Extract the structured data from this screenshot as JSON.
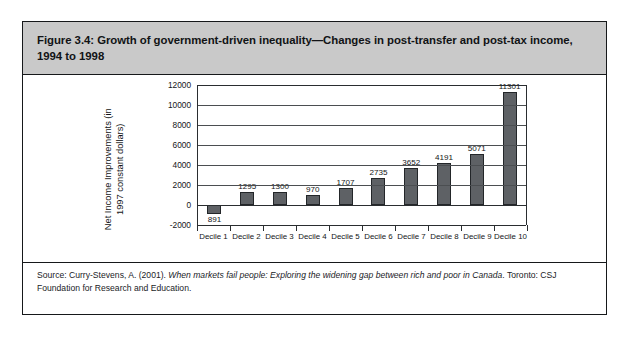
{
  "figure": {
    "title": "Figure 3.4: Growth of government-driven inequality—Changes in post-transfer and post-tax income, 1994 to 1998",
    "source_prefix": "Source: Curry-Stevens, A. (2001). ",
    "source_italic": "When markets fail people: Exploring the widening gap between rich and poor in Canada",
    "source_suffix": ". Toronto: CSJ Foundation for Research and Education."
  },
  "chart_data": {
    "type": "bar",
    "title": "",
    "categories": [
      "Decile 1",
      "Decile 2",
      "Decile 3",
      "Decile 4",
      "Decile 5",
      "Decile 6",
      "Decile 7",
      "Decile 8",
      "Decile 9",
      "Decile 10"
    ],
    "values": [
      -891,
      1295,
      1300,
      970,
      1707,
      2735,
      3652,
      4191,
      5071,
      11301
    ],
    "data_labels": [
      "891",
      "1295",
      "1300",
      "970",
      "1707",
      "2735",
      "3652",
      "4191",
      "5071",
      "11301"
    ],
    "xlabel": "",
    "ylabel": "Net Income Improvements (in 1997 constant dollars)",
    "ylim": [
      -2000,
      12000
    ],
    "yticks": [
      12000,
      10000,
      8000,
      6000,
      4000,
      2000,
      0,
      -2000
    ],
    "ytick_labels": [
      "12000",
      "10000",
      "8000",
      "6000",
      "4000",
      "2000",
      "0",
      "-2000"
    ],
    "grid": true,
    "legend": false,
    "bar_color": "#5e6165",
    "bar_edge_color": "#232629"
  },
  "style": {
    "banner_bg": "#c9c9c9",
    "border_color": "#16181a"
  }
}
